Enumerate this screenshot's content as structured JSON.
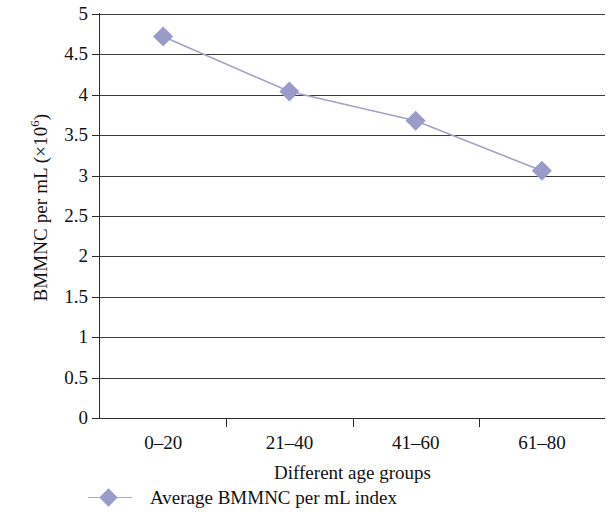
{
  "chart_data": {
    "type": "line",
    "title": "",
    "xlabel": "Different age groups",
    "ylabel": "BMMNC per mL (×10⁶)",
    "ylabel_base": "BMMNC per mL (×10",
    "ylabel_exponent": "6",
    "ylabel_close": ")",
    "categories": [
      "0–20",
      "21–40",
      "41–60",
      "61–80"
    ],
    "series": [
      {
        "name": "Average BMMNC per mL index",
        "values": [
          4.72,
          4.04,
          3.68,
          3.06
        ],
        "marker": "diamond",
        "marker_color": "#9b9bc9",
        "line_color": "#a3a3c4"
      }
    ],
    "ylim": [
      0,
      5
    ],
    "ytick_step": 0.5,
    "yticks": [
      "5",
      "4.5",
      "4",
      "3.5",
      "3",
      "2.5",
      "2",
      "1.5",
      "1",
      "0.5",
      "0"
    ],
    "ytick_values": [
      5,
      4.5,
      4,
      3.5,
      3,
      2.5,
      2,
      1.5,
      1,
      0.5,
      0
    ],
    "grid": "horizontal",
    "legend_position": "bottom-left",
    "legend": [
      "Average BMMNC per mL index"
    ]
  },
  "legend": {
    "entry_label": "Average BMMNC per mL index"
  },
  "axes": {
    "x_title": "Different age groups"
  }
}
